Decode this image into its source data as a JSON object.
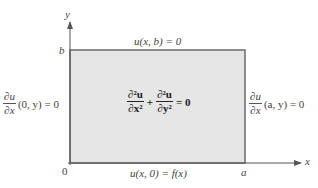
{
  "diagram": {
    "colors": {
      "region_fill": "#e6e6e6",
      "region_border": "#6b6b6b",
      "axis": "#555555",
      "text": "#444444"
    },
    "axes": {
      "x_label": "x",
      "y_label": "y",
      "origin_label": "0",
      "x_tick_label": "a",
      "y_tick_label": "b"
    },
    "equation": {
      "term1_num": "∂²u",
      "term1_den": "∂x²",
      "plus": "+",
      "term2_num": "∂²u",
      "term2_den": "∂y²",
      "rhs": "= 0"
    },
    "boundary_conditions": {
      "top": "u(x, b) = 0",
      "bottom": "u(x, 0) = f(x)",
      "left": {
        "num": "∂u",
        "den": "∂x",
        "args": "(0, y) = 0"
      },
      "right": {
        "num": "∂u",
        "den": "∂x",
        "args": "(a, y) = 0"
      }
    }
  }
}
